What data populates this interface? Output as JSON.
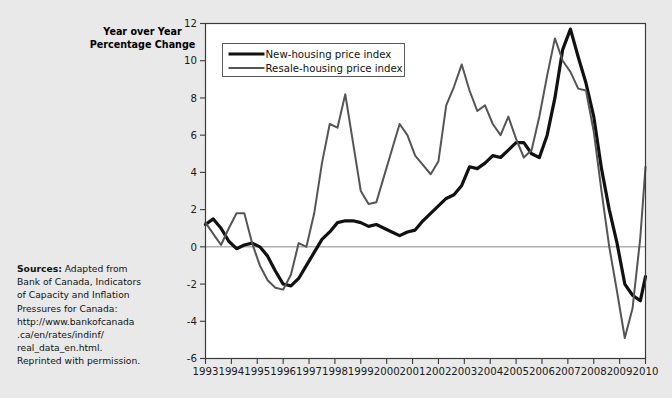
{
  "figure": {
    "axis_title_line1": "Year over Year",
    "axis_title_line2": "Percentage Change",
    "background_color": "#e9e9e9",
    "plot_background_color": "#ffffff",
    "border_color": "#3a3a3a"
  },
  "sources": {
    "label": "Sources:",
    "line1": " Adapted from",
    "line2": "Bank of Canada, Indicators",
    "line3": "of Capacity and Inflation",
    "line4": "Pressures for Canada:",
    "line5": "http://www.bankofcanada",
    "line6": ".ca/en/rates/indinf/",
    "line7": "real_data_en.html.",
    "line8": "Reprinted with permission."
  },
  "legend": {
    "position": "top-left-inside",
    "items": [
      {
        "label": "New-housing price index",
        "color": "#111111",
        "width": 3.2
      },
      {
        "label": "Resale-housing price index",
        "color": "#555555",
        "width": 2.0
      }
    ]
  },
  "chart_data": {
    "type": "line",
    "title": "",
    "subtitle": "",
    "xlabel": "",
    "ylabel": "Year over Year Percentage Change",
    "xlim": [
      1993,
      2010
    ],
    "ylim": [
      -6,
      12
    ],
    "yticks": [
      -6,
      -4,
      -2,
      0,
      2,
      4,
      6,
      8,
      10,
      12
    ],
    "ytick_labels": [
      "-6",
      "-4",
      "-2",
      "0",
      "2",
      "4",
      "6",
      "8",
      "10",
      "12"
    ],
    "xticks": [
      1993,
      1994,
      1995,
      1996,
      1997,
      1998,
      1999,
      2000,
      2001,
      2002,
      2003,
      2004,
      2005,
      2006,
      2007,
      2008,
      2009,
      2010
    ],
    "xtick_labels": [
      "1993",
      "1994",
      "1995",
      "1996",
      "1997",
      "1998",
      "1999",
      "2000",
      "2001",
      "2002",
      "2003",
      "2004",
      "2005",
      "2006",
      "2007",
      "2008",
      "2009",
      "2010"
    ],
    "grid": false,
    "zero_line": true,
    "zero_line_color": "#888888",
    "legend_position": "upper left",
    "series": [
      {
        "name": "New-housing price index",
        "color": "#111111",
        "linewidth": 3.2,
        "x": [
          1993.0,
          1993.3,
          1993.6,
          1993.9,
          1994.2,
          1994.5,
          1994.8,
          1995.1,
          1995.4,
          1995.7,
          1996.0,
          1996.3,
          1996.6,
          1996.9,
          1997.2,
          1997.5,
          1997.8,
          1998.1,
          1998.4,
          1998.7,
          1999.0,
          1999.3,
          1999.6,
          1999.9,
          2000.2,
          2000.5,
          2000.8,
          2001.1,
          2001.4,
          2001.7,
          2002.0,
          2002.3,
          2002.6,
          2002.9,
          2003.2,
          2003.5,
          2003.8,
          2004.1,
          2004.4,
          2004.7,
          2005.0,
          2005.3,
          2005.6,
          2005.9,
          2006.2,
          2006.5,
          2006.8,
          2007.1,
          2007.4,
          2007.7,
          2008.0,
          2008.3,
          2008.6,
          2008.9,
          2009.2,
          2009.5,
          2009.8,
          2010.0
        ],
        "y": [
          1.2,
          1.5,
          1.0,
          0.3,
          -0.1,
          0.1,
          0.2,
          0.0,
          -0.5,
          -1.3,
          -2.0,
          -2.1,
          -1.7,
          -1.0,
          -0.3,
          0.4,
          0.8,
          1.3,
          1.4,
          1.4,
          1.3,
          1.1,
          1.2,
          1.0,
          0.8,
          0.6,
          0.8,
          0.9,
          1.4,
          1.8,
          2.2,
          2.6,
          2.8,
          3.3,
          4.3,
          4.2,
          4.5,
          4.9,
          4.8,
          5.2,
          5.6,
          5.6,
          5.0,
          4.8,
          6.0,
          8.0,
          10.6,
          11.7,
          10.2,
          8.8,
          7.0,
          4.2,
          2.0,
          0.2,
          -2.0,
          -2.6,
          -2.9,
          -1.6
        ]
      },
      {
        "name": "Resale-housing price index",
        "color": "#555555",
        "linewidth": 2.0,
        "x": [
          1993.0,
          1993.3,
          1993.6,
          1993.9,
          1994.2,
          1994.5,
          1994.8,
          1995.1,
          1995.4,
          1995.7,
          1996.0,
          1996.3,
          1996.6,
          1996.9,
          1997.2,
          1997.5,
          1997.8,
          1998.1,
          1998.4,
          1998.7,
          1999.0,
          1999.3,
          1999.6,
          1999.9,
          2000.2,
          2000.5,
          2000.8,
          2001.1,
          2001.4,
          2001.7,
          2002.0,
          2002.3,
          2002.6,
          2002.9,
          2003.2,
          2003.5,
          2003.8,
          2004.1,
          2004.4,
          2004.7,
          2005.0,
          2005.3,
          2005.6,
          2005.9,
          2006.2,
          2006.5,
          2006.8,
          2007.1,
          2007.4,
          2007.7,
          2008.0,
          2008.3,
          2008.6,
          2008.9,
          2009.2,
          2009.5,
          2009.8,
          2010.0
        ],
        "y": [
          1.3,
          0.7,
          0.1,
          1.0,
          1.8,
          1.8,
          0.2,
          -1.0,
          -1.8,
          -2.2,
          -2.3,
          -1.5,
          0.2,
          0.0,
          1.8,
          4.5,
          6.6,
          6.4,
          8.2,
          5.6,
          3.0,
          2.3,
          2.4,
          3.8,
          5.2,
          6.6,
          6.0,
          4.9,
          4.4,
          3.9,
          4.6,
          7.6,
          8.6,
          9.8,
          8.4,
          7.3,
          7.6,
          6.6,
          6.0,
          7.0,
          5.8,
          4.8,
          5.2,
          7.0,
          9.2,
          11.2,
          10.0,
          9.4,
          8.5,
          8.4,
          6.2,
          3.0,
          0.0,
          -2.4,
          -4.9,
          -3.3,
          0.5,
          4.3
        ]
      }
    ]
  }
}
